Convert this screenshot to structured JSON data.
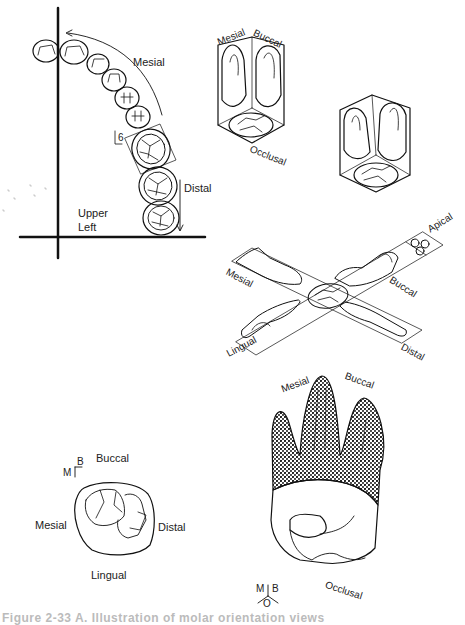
{
  "panel_arch": {
    "title": "Upper arch quadrant",
    "labels": {
      "mesial": "Mesial",
      "distal": "Distal",
      "tooth_number": "6",
      "quadrant_line1": "Upper",
      "quadrant_line2": "Left"
    }
  },
  "panel_box_views": {
    "labels": {
      "mesial": "Mesial",
      "buccal": "Buccal",
      "occlusal": "Occlusal"
    }
  },
  "panel_unfolded": {
    "labels": {
      "apical": "Apical",
      "mesial": "Mesial",
      "buccal": "Buccal",
      "lingual": "Lingual",
      "distal": "Distal"
    }
  },
  "panel_occlusal": {
    "labels": {
      "buccal": "Buccal",
      "mesial": "Mesial",
      "distal": "Distal",
      "lingual": "Lingual",
      "orient_m": "M",
      "orient_b": "B"
    }
  },
  "panel_perspective": {
    "labels": {
      "mesial": "Mesial",
      "buccal": "Buccal",
      "occlusal": "Occlusal",
      "orient_m": "M",
      "orient_b": "B",
      "orient_o": "O"
    }
  },
  "caption": "Figure 2-33 A. Illustration of molar orientation views"
}
